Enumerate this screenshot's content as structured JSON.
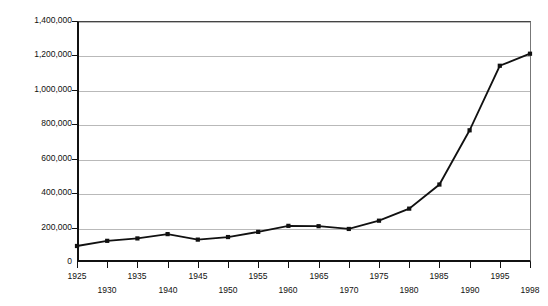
{
  "chart_data": {
    "type": "line",
    "title": "",
    "xlabel": "",
    "ylabel": "Number of prisoners",
    "x": [
      1925,
      1930,
      1935,
      1940,
      1945,
      1950,
      1955,
      1960,
      1965,
      1970,
      1975,
      1980,
      1985,
      1990,
      1995,
      1998
    ],
    "values": [
      93000,
      123000,
      137000,
      162000,
      130000,
      145000,
      175000,
      210000,
      208000,
      192000,
      240000,
      310000,
      450000,
      765000,
      1140000,
      1210000
    ],
    "xtick_labels": [
      "1925",
      "1930",
      "1935",
      "1940",
      "1945",
      "1950",
      "1955",
      "1960",
      "1965",
      "1970",
      "1975",
      "1980",
      "1985",
      "1990",
      "1995",
      "1998"
    ],
    "ytick_labels": [
      "0",
      "200,000",
      "400,000",
      "600,000",
      "800,000",
      "1,000,000",
      "1,200,000",
      "1,400,000"
    ],
    "ytick_values": [
      0,
      200000,
      400000,
      600000,
      800000,
      1000000,
      1200000,
      1400000
    ],
    "ylim": [
      0,
      1400000
    ],
    "xlim": [
      1925,
      1998
    ],
    "grid": true,
    "legend": "none",
    "series_color": "#111111",
    "gridline_color": "#b9b9b9",
    "axis_color": "#111111",
    "background_color": "#ffffff",
    "marker": "square"
  }
}
